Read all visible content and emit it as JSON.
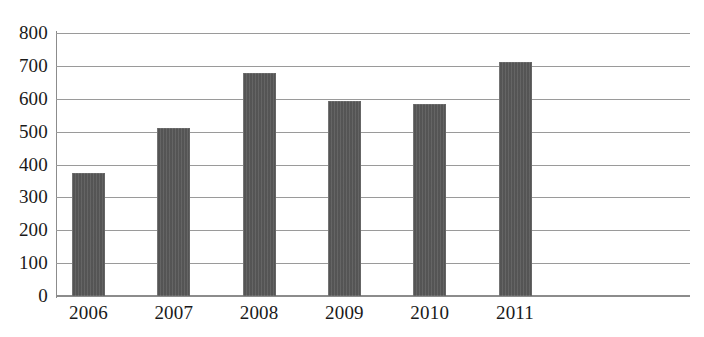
{
  "chart_data": {
    "type": "bar",
    "title": "",
    "subtitle": "",
    "xlabel": "",
    "ylabel": "",
    "categories": [
      "2006",
      "2007",
      "2008",
      "2009",
      "2010",
      "2011"
    ],
    "values": [
      375,
      512,
      677,
      592,
      585,
      713
    ],
    "series": [
      {
        "name": "",
        "values": [
          375,
          512,
          677,
          592,
          585,
          713
        ]
      }
    ],
    "ylim": [
      0,
      800
    ],
    "y_ticks": [
      0,
      100,
      200,
      300,
      400,
      500,
      600,
      700,
      800
    ],
    "y_tick_labels": [
      "0",
      "100",
      "200",
      "300",
      "400",
      "500",
      "600",
      "700",
      "800"
    ],
    "grid": "horizontal",
    "legend": "none",
    "bar_color": "#595959",
    "gridline_color": "#9a9a9a",
    "axis_color": "#8c8c8c",
    "background_color": "#ffffff",
    "annotations": []
  }
}
